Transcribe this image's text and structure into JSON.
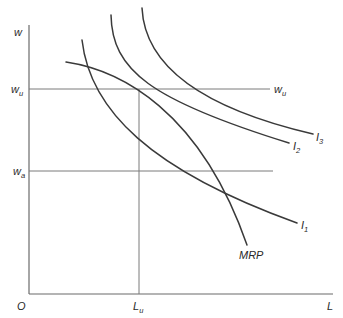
{
  "diagram": {
    "type": "economics-labor-market-indifference-diagram",
    "axes": {
      "y_label": "w",
      "x_label": "L",
      "origin_label": "O"
    },
    "levels": {
      "wu": {
        "label_main": "w",
        "label_sub": "u",
        "right_label_main": "w",
        "right_label_sub": "u"
      },
      "wa": {
        "label_main": "w",
        "label_sub": "a"
      },
      "Lu": {
        "label_main": "L",
        "label_sub": "u"
      }
    },
    "curves": [
      {
        "id": "I1",
        "label_main": "I",
        "label_sub": "1",
        "path": "M 82 40 C 90 110, 150 170, 297 223"
      },
      {
        "id": "I2",
        "label_main": "I",
        "label_sub": "2",
        "path": "M 111 15 C 112 70, 150 100, 289 143"
      },
      {
        "id": "I3",
        "label_main": "I",
        "label_sub": "3",
        "path": "M 142 8 C 145 70, 210 110, 313 134"
      },
      {
        "id": "MRP",
        "label_main": "MRP",
        "label_sub": "",
        "path": "M 66 62 C 120 70, 200 110, 247 245"
      }
    ],
    "colors": {
      "curve": "#3a3a3a",
      "axis": "#6b6b6b",
      "background": "#ffffff"
    }
  }
}
